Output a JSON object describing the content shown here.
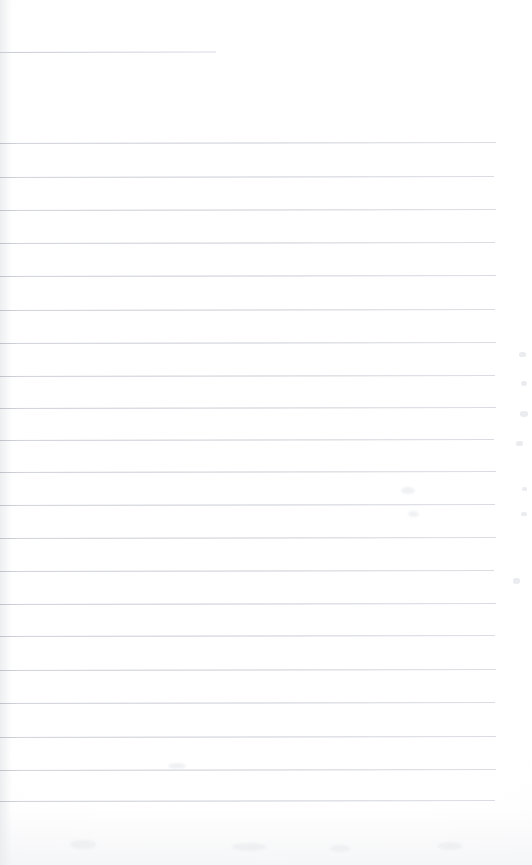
{
  "document": {
    "kind": "scanned-page",
    "title": "Blank ruled notebook page",
    "page_width": 532,
    "page_height": 865,
    "background_color": "#ffffff",
    "rule_color": "#d9dbe0",
    "written_content": "",
    "text_blocks": [],
    "notes": "Scan of an empty lined sheet. No headings, handwriting, printed text, page numbers or captions are present anywhere in the pixels."
  },
  "ruled_lines": {
    "count": 21,
    "spacing_px": 33,
    "left_edge_x": 0,
    "right_edge_x": 496,
    "lines": [
      {
        "index": 0,
        "y": 52,
        "x_start": 0,
        "x_end": 216,
        "variant": "short"
      },
      {
        "index": 1,
        "y": 143,
        "x_start": 0,
        "x_end": 496,
        "variant": "full"
      },
      {
        "index": 2,
        "y": 177,
        "x_start": 0,
        "x_end": 494,
        "variant": "full"
      },
      {
        "index": 3,
        "y": 210,
        "x_start": 0,
        "x_end": 496,
        "variant": "full"
      },
      {
        "index": 4,
        "y": 243,
        "x_start": 0,
        "x_end": 495,
        "variant": "full"
      },
      {
        "index": 5,
        "y": 276,
        "x_start": 0,
        "x_end": 496,
        "variant": "full"
      },
      {
        "index": 6,
        "y": 310,
        "x_start": 0,
        "x_end": 495,
        "variant": "full"
      },
      {
        "index": 7,
        "y": 343,
        "x_start": 0,
        "x_end": 496,
        "variant": "full"
      },
      {
        "index": 8,
        "y": 376,
        "x_start": 0,
        "x_end": 495,
        "variant": "full"
      },
      {
        "index": 9,
        "y": 408,
        "x_start": 0,
        "x_end": 496,
        "variant": "full"
      },
      {
        "index": 10,
        "y": 440,
        "x_start": 0,
        "x_end": 494,
        "variant": "full"
      },
      {
        "index": 11,
        "y": 472,
        "x_start": 0,
        "x_end": 496,
        "variant": "full"
      },
      {
        "index": 12,
        "y": 505,
        "x_start": 0,
        "x_end": 495,
        "variant": "full"
      },
      {
        "index": 13,
        "y": 538,
        "x_start": 0,
        "x_end": 496,
        "variant": "full"
      },
      {
        "index": 14,
        "y": 571,
        "x_start": 0,
        "x_end": 494,
        "variant": "full"
      },
      {
        "index": 15,
        "y": 604,
        "x_start": 0,
        "x_end": 496,
        "variant": "full"
      },
      {
        "index": 16,
        "y": 636,
        "x_start": 0,
        "x_end": 495,
        "variant": "full"
      },
      {
        "index": 17,
        "y": 670,
        "x_start": 0,
        "x_end": 496,
        "variant": "full"
      },
      {
        "index": 18,
        "y": 703,
        "x_start": 0,
        "x_end": 495,
        "variant": "full"
      },
      {
        "index": 19,
        "y": 737,
        "x_start": 0,
        "x_end": 496,
        "variant": "full"
      },
      {
        "index": 20,
        "y": 770,
        "x_start": 0,
        "x_end": 496,
        "variant": "full"
      },
      {
        "index": 21,
        "y": 801,
        "x_start": 0,
        "x_end": 495,
        "variant": "full"
      }
    ]
  },
  "artifacts": {
    "margin_marks": [
      {
        "x": 519,
        "y": 352,
        "w": 7,
        "h": 5
      },
      {
        "x": 521,
        "y": 381,
        "w": 6,
        "h": 5
      },
      {
        "x": 520,
        "y": 411,
        "w": 8,
        "h": 6
      },
      {
        "x": 516,
        "y": 441,
        "w": 7,
        "h": 5
      },
      {
        "x": 522,
        "y": 487,
        "w": 5,
        "h": 4
      },
      {
        "x": 513,
        "y": 578,
        "w": 7,
        "h": 6
      },
      {
        "x": 521,
        "y": 512,
        "w": 6,
        "h": 4
      }
    ],
    "smudges": [
      {
        "x": 401,
        "y": 487,
        "w": 14,
        "h": 7
      },
      {
        "x": 408,
        "y": 511,
        "w": 11,
        "h": 6
      },
      {
        "x": 70,
        "y": 840,
        "w": 26,
        "h": 9
      },
      {
        "x": 232,
        "y": 843,
        "w": 34,
        "h": 8
      },
      {
        "x": 330,
        "y": 845,
        "w": 20,
        "h": 7
      },
      {
        "x": 438,
        "y": 842,
        "w": 24,
        "h": 8
      },
      {
        "x": 168,
        "y": 763,
        "w": 18,
        "h": 6
      }
    ]
  }
}
